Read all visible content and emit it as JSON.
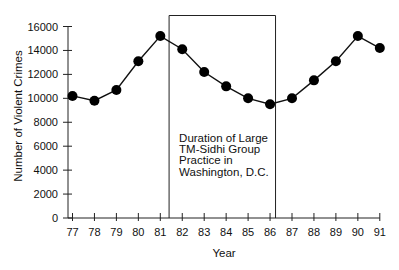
{
  "chart_data": {
    "type": "line",
    "title": "",
    "xlabel": "Year",
    "ylabel": "Number of Violent Crimes",
    "x": [
      "77",
      "78",
      "79",
      "80",
      "81",
      "82",
      "83",
      "84",
      "85",
      "86",
      "87",
      "88",
      "89",
      "90",
      "91"
    ],
    "series": [
      {
        "name": "Violent Crimes",
        "values": [
          10200,
          9800,
          10700,
          13100,
          15200,
          14100,
          12200,
          11000,
          10000,
          9500,
          10000,
          11500,
          13100,
          15200,
          14200
        ]
      }
    ],
    "ylim": [
      0,
      16000
    ],
    "yticks": [
      0,
      2000,
      4000,
      6000,
      8000,
      10000,
      12000,
      14000,
      16000
    ],
    "grid": false,
    "legend": null,
    "annotations": [
      {
        "type": "box",
        "x_start": 81.4,
        "x_end": 86.25,
        "lines": [
          "Duration of Large",
          "TM-Sidhi Group",
          "Practice in",
          "Washington, D.C."
        ]
      }
    ],
    "colors": {
      "line": "#111111",
      "marker": "#000000",
      "axis": "#222222"
    }
  }
}
